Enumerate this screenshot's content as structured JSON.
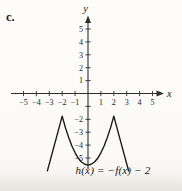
{
  "page": {
    "item_label": "c.",
    "function_label": "h(x) = −f(x) − 2"
  },
  "colors": {
    "axis": "#2f2f2f",
    "curve": "#1b1b1b",
    "text": "#232323"
  },
  "chart_data": {
    "type": "line",
    "title": "",
    "xlabel": "x",
    "ylabel": "y",
    "xlim": [
      -5.9,
      6.2
    ],
    "ylim": [
      -6.8,
      6.0
    ],
    "grid": false,
    "legend": "none",
    "xticks": [
      -5,
      -4,
      -3,
      -2,
      -1,
      1,
      2,
      3,
      4,
      5
    ],
    "yticks": [
      -5,
      -4,
      -3,
      -2,
      -1,
      1,
      2,
      3,
      4,
      5
    ],
    "yticks_unlabeled": [
      -1
    ],
    "annotation": "h(x) = −f(x) − 2",
    "series": [
      {
        "name": "h(x) = −f(x) − 2",
        "shape": "W-shaped curve below x-axis: straight outer arms, sharp peaks at x = ±2 near y = −2, smooth parabolic valley with minimum at (0, −5.5)",
        "key_features": {
          "peaks": [
            [
              -2,
              -2
            ],
            [
              2,
              -2
            ]
          ],
          "local_min": [
            0,
            -5.5
          ],
          "left_end": [
            -3.15,
            -6.0
          ],
          "right_end": [
            3.15,
            -6.0
          ]
        },
        "points": [
          [
            -3.15,
            -6.0
          ],
          [
            -2,
            -1.75
          ],
          [
            -1.75,
            -2.64
          ],
          [
            -1.5,
            -3.41
          ],
          [
            -1.25,
            -4.07
          ],
          [
            -1,
            -4.6
          ],
          [
            -0.75,
            -5.02
          ],
          [
            -0.5,
            -5.31
          ],
          [
            -0.25,
            -5.49
          ],
          [
            0,
            -5.55
          ],
          [
            0.25,
            -5.49
          ],
          [
            0.5,
            -5.31
          ],
          [
            0.75,
            -5.02
          ],
          [
            1,
            -4.6
          ],
          [
            1.25,
            -4.07
          ],
          [
            1.5,
            -3.41
          ],
          [
            1.75,
            -2.64
          ],
          [
            2,
            -1.75
          ],
          [
            3.15,
            -6.0
          ]
        ]
      }
    ]
  }
}
